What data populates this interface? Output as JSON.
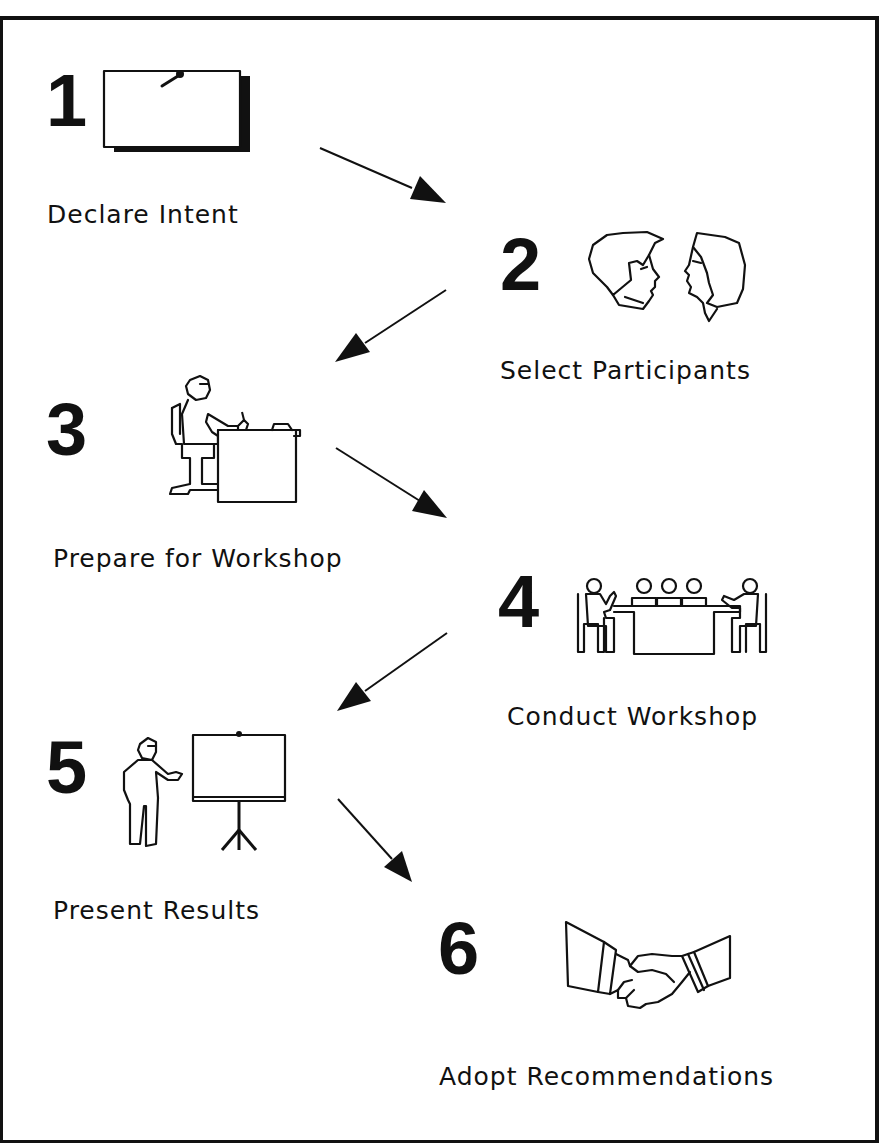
{
  "diagram": {
    "type": "process-flow",
    "direction": "zigzag top-to-bottom",
    "steps": [
      {
        "number": "1",
        "label": "Declare Intent",
        "icon": "memo-board-icon"
      },
      {
        "number": "2",
        "label": "Select Participants",
        "icon": "two-heads-icon"
      },
      {
        "number": "3",
        "label": "Prepare for Workshop",
        "icon": "person-at-desk-icon"
      },
      {
        "number": "4",
        "label": "Conduct Workshop",
        "icon": "meeting-table-icon"
      },
      {
        "number": "5",
        "label": "Present Results",
        "icon": "presenter-easel-icon"
      },
      {
        "number": "6",
        "label": "Adopt Recommendations",
        "icon": "handshake-icon"
      }
    ],
    "arrows": [
      {
        "from": "1",
        "to": "2"
      },
      {
        "from": "2",
        "to": "3"
      },
      {
        "from": "3",
        "to": "4"
      },
      {
        "from": "4",
        "to": "5"
      },
      {
        "from": "5",
        "to": "6"
      }
    ]
  },
  "colors": {
    "ink": "#111111",
    "background": "#ffffff"
  }
}
